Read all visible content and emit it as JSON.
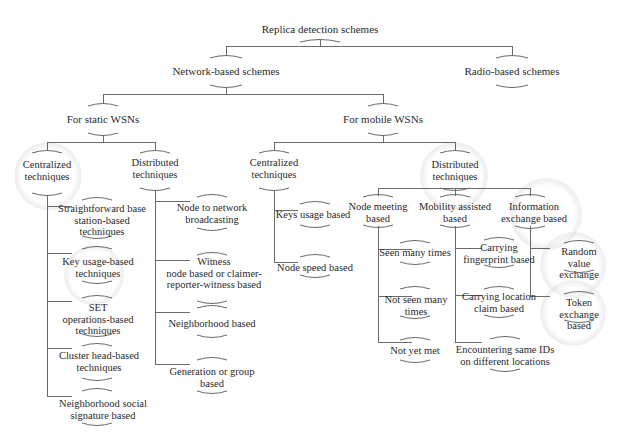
{
  "diagram": {
    "title": "Replica detection schemes",
    "nodes": {
      "root": "Replica detection schemes",
      "network": "Network-based schemes",
      "radio": "Radio-based schemes",
      "static": "For static WSNs",
      "mobile": "For mobile WSNs",
      "s_central": "Centralized\ntechniques",
      "s_distrib": "Distributed\ntechniques",
      "m_central": "Centralized\ntechniques",
      "m_distrib": "Distributed\ntechniques",
      "sc_1": "Straightforward base\nstation-based\ntechniques",
      "sc_2": "Key usage-based\ntechniques",
      "sc_3": "SET\noperations-based\ntechniques",
      "sc_4": "Cluster head-based\ntechniques",
      "sc_5": "Neighborhood social\nsignature based",
      "sd_1": "Node to network\nbroadcasting",
      "sd_2": "Witness\nnode based or claimer-\nreporter-witness based",
      "sd_3": "Neighborhood based",
      "sd_4": "Generation or group\nbased",
      "mc_1": "Keys usage based",
      "mc_2": "Node speed based",
      "md_meet": "Node meeting\nbased",
      "md_mob": "Mobility assisted\nbased",
      "md_info": "Information\nexchange based",
      "meet_1": "Seen many times",
      "meet_2": "Not seen many\ntimes",
      "meet_3": "Not yet met",
      "mob_1": "Carrying\nfingerprint based",
      "mob_2": "Carrying location\nclaim based",
      "mob_3": "Encountering same IDs\non different locations",
      "info_1": "Random value\nexchange",
      "info_2": "Token exchange\nbased"
    },
    "line_color": "#6a6a6a",
    "text_color": "#2a2a2a"
  }
}
